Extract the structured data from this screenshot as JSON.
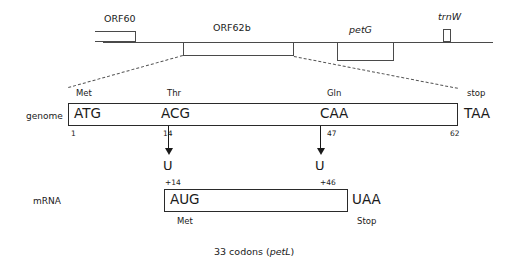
{
  "gene_map": {
    "genes": [
      {
        "name": "ORF60",
        "style": "plain"
      },
      {
        "name": "ORF62b",
        "style": "plain"
      },
      {
        "name": "petG",
        "style": "italic"
      },
      {
        "name": "trnW",
        "style": "italic"
      }
    ]
  },
  "genome_row": {
    "row_label": "genome",
    "codons": [
      {
        "codon": "ATG",
        "amino_acid": "Met",
        "position": "1"
      },
      {
        "codon": "ACG",
        "amino_acid": "Thr",
        "position": "14"
      },
      {
        "codon": "CAA",
        "amino_acid": "Gln",
        "position": "47"
      }
    ],
    "end_position": "62",
    "terminator_codon": "TAA",
    "terminator_label": "stop"
  },
  "editing": {
    "events": [
      {
        "base": "U",
        "mrna_position": "+14",
        "genome_position": "14"
      },
      {
        "base": "U",
        "mrna_position": "+46",
        "genome_position": "47"
      }
    ]
  },
  "mrna_row": {
    "row_label": "mRNA",
    "start_codon": "AUG",
    "start_label": "Met",
    "stop_codon": "UAA",
    "stop_label": "Stop"
  },
  "caption": {
    "text_before": "33 codons (",
    "gene": "petL",
    "text_after": ")"
  }
}
